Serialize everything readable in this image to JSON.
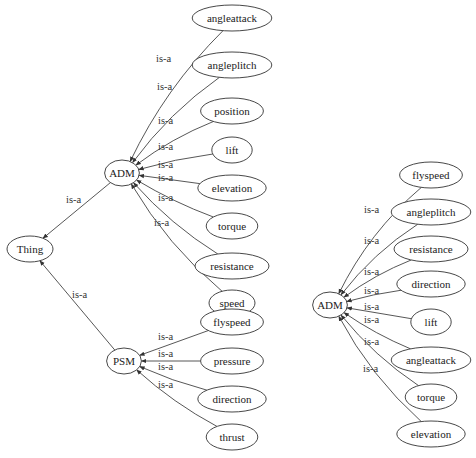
{
  "diagram": {
    "edge_label": "is-a",
    "graphs": [
      {
        "id": "left",
        "root": "Thing",
        "children": [
          {
            "name": "ADM",
            "edge_label": "is-a",
            "children": [
              "angleattack",
              "angleplitch",
              "position",
              "lift",
              "elevation",
              "torque",
              "resistance",
              "speed"
            ]
          },
          {
            "name": "PSM",
            "edge_label": "is-a",
            "children": [
              "flyspeed",
              "pressure",
              "direction",
              "thrust"
            ]
          }
        ]
      },
      {
        "id": "right",
        "root": "ADM",
        "children": [
          "flyspeed",
          "angleplitch",
          "resistance",
          "direction",
          "lift",
          "angleattack",
          "torque",
          "elevation"
        ]
      }
    ]
  }
}
